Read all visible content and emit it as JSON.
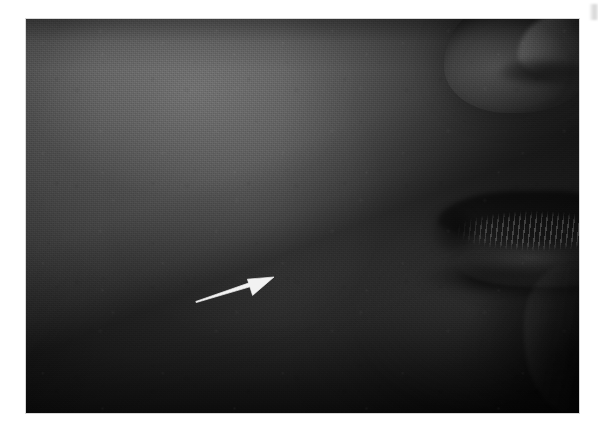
{
  "figure": {
    "type": "clinical-photograph",
    "modality": "grayscale photograph",
    "caption": "",
    "orientation": "right lateral profile, face directed to the right",
    "description": "Black and white close-up clinical photograph of the left lower face in profile. A white arrow overlaid on the image points upward and to the right toward a subtle area of the cheek / jaw region. The lips and nostril appear at the right edge of the frame, in deep shadow.",
    "background_color": "#ffffff",
    "plate": {
      "name": "photo-plate",
      "left": 26,
      "top": 19,
      "width": 553,
      "height": 394,
      "dominant_tone": "#4a4a4a",
      "highlight_tone": "#6a6a6a",
      "shadow_tone": "#0d0d0d",
      "border_color": "#d8d8d8"
    },
    "annotation": {
      "kind": "arrow",
      "color": "#f2f2f2",
      "label": "",
      "points_to": "cheek / jaw skin lesion",
      "tail_x": 170,
      "tail_y": 283,
      "tip_x": 248,
      "tip_y": 258,
      "shaft_start_width": 1.2,
      "shaft_end_width": 4.0,
      "head_length": 26,
      "head_half_width": 11
    },
    "regions": [
      {
        "name": "cheek",
        "label": "cheek"
      },
      {
        "name": "jawline",
        "label": "jawline"
      },
      {
        "name": "nasolabial-fold",
        "label": "nasolabial fold"
      },
      {
        "name": "upper-lip",
        "label": "upper lip"
      },
      {
        "name": "lower-lip",
        "label": "lower lip"
      },
      {
        "name": "mouth-corner",
        "label": "oral commissure"
      },
      {
        "name": "nasal-ala",
        "label": "nasal ala"
      },
      {
        "name": "chin",
        "label": "chin"
      }
    ],
    "corner_mark": {
      "name": "page-corner-mark",
      "visible": true,
      "description": "faint grey scanning artefact at the top right page edge"
    }
  }
}
